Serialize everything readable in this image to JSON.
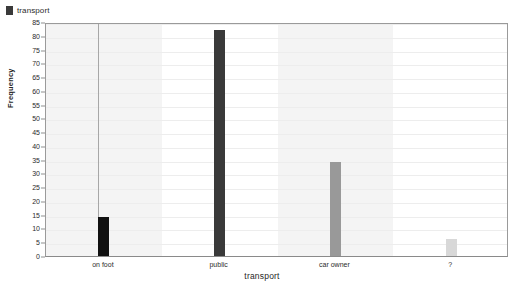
{
  "legend": {
    "position": "top-left",
    "entries": [
      {
        "label": "transport",
        "color": "#3a3a3a",
        "marker": "square-swatch-icon"
      }
    ]
  },
  "axes": {
    "x_title": "transport",
    "y_title": "Frequency"
  },
  "chart_data": {
    "type": "bar",
    "title": "",
    "subtitle": "",
    "xlabel": "transport",
    "ylabel": "Frequency",
    "categories": [
      "on foot",
      "public",
      "car owner",
      "?"
    ],
    "values": [
      14,
      82,
      34,
      6
    ],
    "series": [
      {
        "name": "transport",
        "values": [
          14,
          82,
          34,
          6
        ],
        "colors": [
          "#111111",
          "#3a3a3a",
          "#999999",
          "#d8d8d8"
        ]
      }
    ],
    "ylim": [
      0,
      85
    ],
    "ytick_step": 5,
    "yticks": [
      0,
      5,
      10,
      15,
      20,
      25,
      30,
      35,
      40,
      45,
      50,
      55,
      60,
      65,
      70,
      75,
      80,
      85
    ],
    "ytick_labels": [
      "0",
      "5",
      "10",
      "15",
      "20",
      "25",
      "30",
      "35",
      "40",
      "45",
      "50",
      "55",
      "60",
      "65",
      "70",
      "75",
      "80",
      "85"
    ],
    "grid": true,
    "legend_position": "top-left",
    "background": "#ffffff",
    "band_colors": [
      "#f4f4f4",
      "#ffffff",
      "#f4f4f4",
      "#ffffff"
    ],
    "frame_color": "#9a9a9a"
  }
}
